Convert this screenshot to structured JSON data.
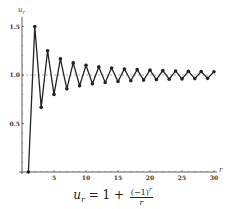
{
  "chart_data": {
    "type": "line",
    "title": "",
    "caption": "u_r = 1 + (-1)^r / r",
    "xlabel": "r",
    "ylabel": "u_r",
    "xlim": [
      0,
      30
    ],
    "ylim": [
      0,
      1.5
    ],
    "x_ticks": [
      5,
      10,
      15,
      20,
      25,
      30
    ],
    "y_ticks": [
      0.5,
      1.0,
      1.5
    ],
    "y_tick_labels": [
      "0.5",
      "1.0",
      "1.5"
    ],
    "grid": false,
    "legend": null,
    "reference_line": {
      "y": 1.0,
      "style": "dashed"
    },
    "markers": true,
    "x": [
      1,
      2,
      3,
      4,
      5,
      6,
      7,
      8,
      9,
      10,
      11,
      12,
      13,
      14,
      15,
      16,
      17,
      18,
      19,
      20,
      21,
      22,
      23,
      24,
      25,
      26,
      27,
      28,
      29,
      30
    ],
    "values": [
      0,
      1.5,
      0.6667,
      1.25,
      0.8,
      1.1667,
      0.8571,
      1.125,
      0.8889,
      1.1,
      0.9091,
      1.0833,
      0.9231,
      1.0714,
      0.9333,
      1.0625,
      0.9412,
      1.0556,
      0.9474,
      1.05,
      0.9524,
      1.0455,
      0.9565,
      1.0417,
      0.96,
      1.0385,
      0.963,
      1.0357,
      0.9655,
      1.0333
    ]
  },
  "caption": {
    "lhs": "u",
    "lhs_sub": "r",
    "eq": " = 1 + ",
    "numerator": "(−1)",
    "numerator_sup": "r",
    "denominator": "r"
  },
  "axes": {
    "x_label": "r",
    "y_label": "u",
    "y_label_sub": "r"
  },
  "colors": {
    "line": "#222222",
    "axis": "#333333",
    "reference": "#777777"
  }
}
